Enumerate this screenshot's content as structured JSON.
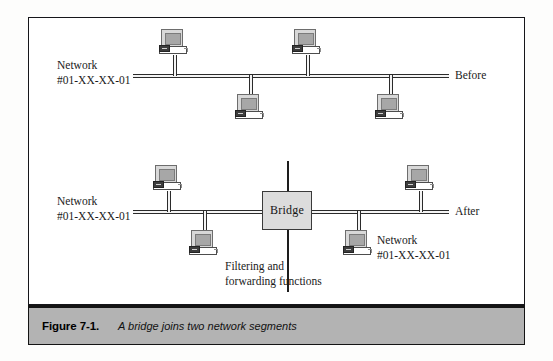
{
  "figure": {
    "caption_number": "Figure 7-1.",
    "caption_text": "A bridge joins two network segments"
  },
  "diagrams": {
    "before": {
      "state_label": "Before",
      "network_label_line1": "Network",
      "network_label_line2": "#01-XX-XX-01",
      "nodes": [
        {
          "name": "workstation-top-left",
          "x": 158,
          "y": 28,
          "side": "above"
        },
        {
          "name": "workstation-top-right",
          "x": 291,
          "y": 28,
          "side": "above"
        },
        {
          "name": "workstation-bottom-left",
          "x": 234,
          "y": 93,
          "side": "below"
        },
        {
          "name": "workstation-bottom-right",
          "x": 374,
          "y": 93,
          "side": "below"
        }
      ]
    },
    "after": {
      "state_label": "After",
      "left_network_label_line1": "Network",
      "left_network_label_line2": "#01-XX-XX-01",
      "right_network_label_line1": "Network",
      "right_network_label_line2": "#01-XX-XX-01",
      "bridge_label": "Bridge",
      "annotation_line1": "Filtering and",
      "annotation_line2": "forwarding functions",
      "nodes": [
        {
          "name": "workstation-left-above",
          "x": 152,
          "y": 164,
          "side": "above"
        },
        {
          "name": "workstation-left-below",
          "x": 188,
          "y": 228,
          "side": "below"
        },
        {
          "name": "workstation-right-below",
          "x": 342,
          "y": 228,
          "side": "below"
        },
        {
          "name": "workstation-right-above",
          "x": 404,
          "y": 164,
          "side": "above"
        }
      ]
    }
  },
  "colors": {
    "frame_border": "#16161a",
    "caption_bar_background": "#b3b3b3",
    "bridge_fill": "#dcdcdc",
    "screen_fill": "#a7a7a7",
    "line": "#2b2b2b"
  }
}
